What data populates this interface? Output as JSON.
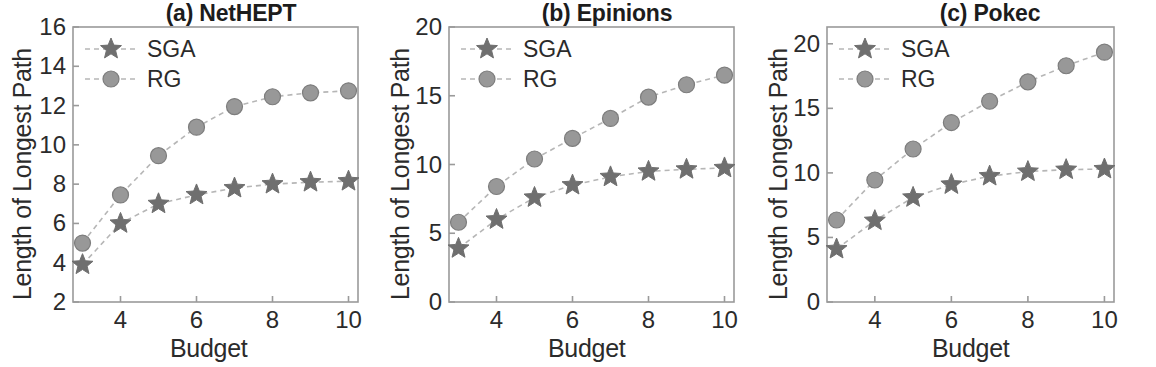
{
  "figure": {
    "xlabel": "Budget",
    "ylabel": "Length of Longest Path",
    "legend": {
      "sga_label": "SGA",
      "rg_label": "RG"
    },
    "colors": {
      "sga_marker": "#6f6f6f",
      "rg_marker": "#989898",
      "line": "#b6b6b6",
      "axis": "#9a9a9a",
      "text": "#2b2b2b",
      "title": "#1c1c1c",
      "background": "#ffffff"
    }
  },
  "panels": [
    {
      "id": "netHEPT",
      "title": "(a) NetHEPT",
      "xlabel": "Budget",
      "ylabel": "Length of Longest Path",
      "xticks": [
        4,
        6,
        8,
        10
      ],
      "xtick_labels": [
        "4",
        "6",
        "8",
        "10"
      ],
      "yticks": [
        2,
        4,
        6,
        8,
        10,
        12,
        14,
        16
      ],
      "ytick_labels": [
        "2",
        "4",
        "6",
        "8",
        "10",
        "12",
        "14",
        "16"
      ],
      "xlim": [
        2.75,
        10.25
      ],
      "ylim": [
        2,
        16
      ]
    },
    {
      "id": "epinions",
      "title": "(b) Epinions",
      "xlabel": "Budget",
      "ylabel": "Length of Longest Path",
      "xticks": [
        4,
        6,
        8,
        10
      ],
      "xtick_labels": [
        "4",
        "6",
        "8",
        "10"
      ],
      "yticks": [
        0,
        5,
        10,
        15,
        20
      ],
      "ytick_labels": [
        "0",
        "5",
        "10",
        "15",
        "20"
      ],
      "xlim": [
        2.75,
        10.25
      ],
      "ylim": [
        0,
        20
      ]
    },
    {
      "id": "pokec",
      "title": "(c) Pokec",
      "xlabel": "Budget",
      "ylabel": "Length of Longest Path",
      "xticks": [
        4,
        6,
        8,
        10
      ],
      "xtick_labels": [
        "4",
        "6",
        "8",
        "10"
      ],
      "yticks": [
        0,
        5,
        10,
        15,
        20
      ],
      "ytick_labels": [
        "0",
        "5",
        "10",
        "15",
        "20"
      ],
      "xlim": [
        2.75,
        10.25
      ],
      "ylim": [
        0,
        21.3
      ]
    }
  ],
  "chart_data": [
    {
      "type": "line",
      "title": "(a) NetHEPT",
      "xlabel": "Budget",
      "ylabel": "Length of Longest Path",
      "x": [
        3,
        4,
        5,
        6,
        7,
        8,
        9,
        10
      ],
      "xlim": [
        2.75,
        10.25
      ],
      "ylim": [
        2,
        16
      ],
      "xticks": [
        4,
        6,
        8,
        10
      ],
      "yticks": [
        2,
        4,
        6,
        8,
        10,
        12,
        14,
        16
      ],
      "grid": false,
      "legend_position": "upper left",
      "series": [
        {
          "name": "SGA",
          "marker": "star",
          "values": [
            3.9,
            6.0,
            7.0,
            7.45,
            7.8,
            8.0,
            8.1,
            8.15
          ]
        },
        {
          "name": "RG",
          "marker": "circle",
          "values": [
            5.0,
            7.45,
            9.45,
            10.9,
            11.95,
            12.45,
            12.65,
            12.75
          ]
        }
      ]
    },
    {
      "type": "line",
      "title": "(b) Epinions",
      "xlabel": "Budget",
      "ylabel": "Length of Longest Path",
      "x": [
        3,
        4,
        5,
        6,
        7,
        8,
        9,
        10
      ],
      "xlim": [
        2.75,
        10.25
      ],
      "ylim": [
        0,
        20
      ],
      "xticks": [
        4,
        6,
        8,
        10
      ],
      "yticks": [
        0,
        5,
        10,
        15,
        20
      ],
      "grid": false,
      "legend_position": "upper left",
      "series": [
        {
          "name": "SGA",
          "marker": "star",
          "values": [
            3.9,
            6.0,
            7.6,
            8.5,
            9.1,
            9.5,
            9.65,
            9.75
          ]
        },
        {
          "name": "RG",
          "marker": "circle",
          "values": [
            5.8,
            8.4,
            10.4,
            11.9,
            13.35,
            14.9,
            15.8,
            16.5
          ]
        }
      ]
    },
    {
      "type": "line",
      "title": "(c) Pokec",
      "xlabel": "Budget",
      "ylabel": "Length of Longest Path",
      "x": [
        3,
        4,
        5,
        6,
        7,
        8,
        9,
        10
      ],
      "xlim": [
        2.75,
        10.25
      ],
      "ylim": [
        0,
        21.3
      ],
      "xticks": [
        4,
        6,
        8,
        10
      ],
      "yticks": [
        0,
        5,
        10,
        15,
        20
      ],
      "grid": false,
      "legend_position": "upper left",
      "series": [
        {
          "name": "SGA",
          "marker": "star",
          "values": [
            4.1,
            6.3,
            8.1,
            9.1,
            9.75,
            10.1,
            10.25,
            10.3
          ]
        },
        {
          "name": "RG",
          "marker": "circle",
          "values": [
            6.35,
            9.45,
            11.85,
            13.9,
            15.55,
            17.05,
            18.3,
            19.35
          ]
        }
      ]
    }
  ]
}
